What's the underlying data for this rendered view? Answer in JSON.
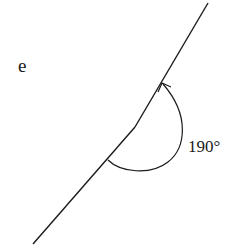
{
  "figure": {
    "label": "e",
    "angle_label": "190°",
    "angle_value_degrees": 190,
    "colors": {
      "stroke": "#1a1a1a",
      "background": "#ffffff"
    }
  }
}
